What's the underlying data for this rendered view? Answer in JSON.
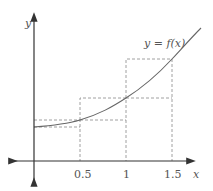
{
  "diagram": {
    "type": "riemann-sum-graph",
    "curve_label": "y = f(x)",
    "x_axis_label": "x",
    "y_axis_label": "y",
    "x_ticks": [
      "0.5",
      "1",
      "1.5"
    ],
    "rectangles": [
      {
        "from": 0,
        "to": 0.5,
        "lower_height_px": 127,
        "upper_height_px": 120
      },
      {
        "from": 0.5,
        "to": 1,
        "lower_height_px": 120,
        "upper_height_px": 98
      },
      {
        "from": 1,
        "to": 1.5,
        "lower_height_px": 98,
        "upper_height_px": 59
      }
    ],
    "colors": {
      "axis": "#333333",
      "curve": "#666666",
      "dashed": "#888888",
      "text": "#555555"
    }
  }
}
